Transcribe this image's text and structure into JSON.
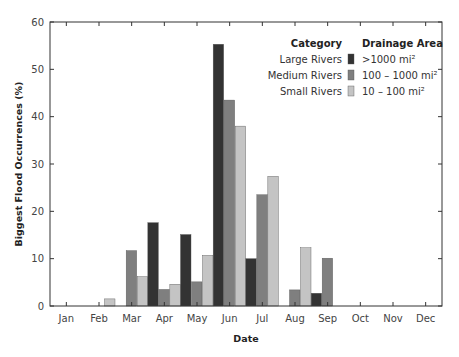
{
  "chart_data": {
    "type": "bar",
    "title": "",
    "xlabel": "Date",
    "ylabel": "Biggest Flood Occurrences (%)",
    "ylim": [
      0,
      60
    ],
    "yticks": [
      0,
      10,
      20,
      30,
      40,
      50,
      60
    ],
    "grid": false,
    "legend_position": "upper right",
    "legend_headers": {
      "category": "Category",
      "area": "Drainage Area"
    },
    "categories": [
      "Jan",
      "Feb",
      "Mar",
      "Apr",
      "May",
      "Jun",
      "Jul",
      "Aug",
      "Sep",
      "Oct",
      "Nov",
      "Dec"
    ],
    "series": [
      {
        "name": "Large Rivers",
        "area": ">1000 mi²",
        "color": "#333333",
        "values": [
          0,
          0,
          0,
          17.6,
          15.1,
          55.3,
          10.0,
          0,
          2.7,
          0,
          0,
          0
        ]
      },
      {
        "name": "Medium Rivers",
        "area": "100 – 1000 mi²",
        "color": "#7f7f7f",
        "values": [
          0,
          0,
          11.7,
          3.5,
          5.1,
          43.5,
          23.5,
          3.4,
          10.1,
          0,
          0,
          0
        ]
      },
      {
        "name": "Small Rivers",
        "area": "10 – 100 mi²",
        "color": "#c4c4c4",
        "values": [
          0,
          1.5,
          6.2,
          4.6,
          10.7,
          38.0,
          27.4,
          12.3,
          0,
          0,
          0,
          0
        ]
      }
    ]
  }
}
